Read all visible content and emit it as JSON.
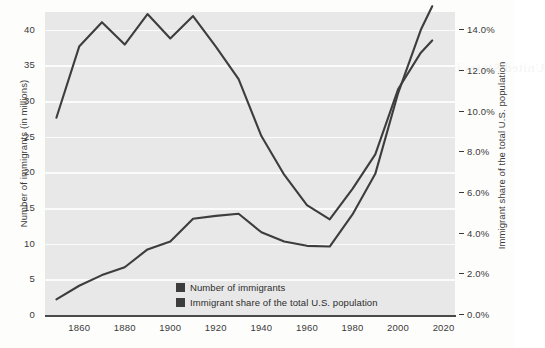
{
  "chart_data": {
    "type": "line",
    "title": "",
    "xlabel": "",
    "ylabel": "Number of immigrants (in millions)",
    "ylabel_right": "Immigrant share of the total U.S. population",
    "xlim": [
      1845,
      2025
    ],
    "ylim": [
      0,
      42.5
    ],
    "ylim_right": [
      0.0,
      14.9
    ],
    "grid": true,
    "legend_position": "lower-center",
    "x_ticks": [
      "1860",
      "1880",
      "1900",
      "1920",
      "1940",
      "1960",
      "1980",
      "2000",
      "2020"
    ],
    "x_tick_values": [
      1860,
      1880,
      1900,
      1920,
      1940,
      1960,
      1980,
      2000,
      2020
    ],
    "y_ticks_left": [
      "0",
      "5",
      "10",
      "15",
      "20",
      "25",
      "30",
      "35",
      "40"
    ],
    "y_tick_values_left": [
      0,
      5,
      10,
      15,
      20,
      25,
      30,
      35,
      40
    ],
    "y_ticks_right": [
      "0.0%",
      "2.0%",
      "4.0%",
      "6.0%",
      "8.0%",
      "10.0%",
      "12.0%",
      "14.0%"
    ],
    "y_tick_values_right": [
      0.0,
      2.0,
      4.0,
      6.0,
      8.0,
      10.0,
      12.0,
      14.0
    ],
    "x": [
      1850,
      1860,
      1870,
      1880,
      1890,
      1900,
      1910,
      1920,
      1930,
      1940,
      1950,
      1960,
      1970,
      1980,
      1990,
      2000,
      2010,
      2015
    ],
    "series": [
      {
        "name": "Number of immigrants",
        "axis": "left",
        "units": "millions",
        "color": "#3d3d3d",
        "values": [
          2.2,
          4.1,
          5.6,
          6.7,
          9.2,
          10.3,
          13.5,
          13.9,
          14.2,
          11.6,
          10.3,
          9.7,
          9.6,
          14.1,
          19.8,
          31.1,
          40.0,
          43.3
        ]
      },
      {
        "name": "Immigrant share of the total U.S. population",
        "axis": "right",
        "units": "percent",
        "color": "#3d3d3d",
        "values": [
          9.7,
          13.2,
          14.4,
          13.3,
          14.8,
          13.6,
          14.7,
          13.2,
          11.6,
          8.8,
          6.9,
          5.4,
          4.7,
          6.2,
          7.9,
          11.1,
          12.9,
          13.5
        ]
      }
    ]
  },
  "legend": {
    "items": [
      {
        "label": "Number of immigrants",
        "color": "#3d3d3d"
      },
      {
        "label": "Immigrant share of the total U.S. population",
        "color": "#3d3d3d"
      }
    ]
  },
  "ghost_text": {
    "line1": "Immigration",
    "line2": "POPULATION",
    "line3": "the share of the total population",
    "line4": "United States immigrant share over time"
  }
}
